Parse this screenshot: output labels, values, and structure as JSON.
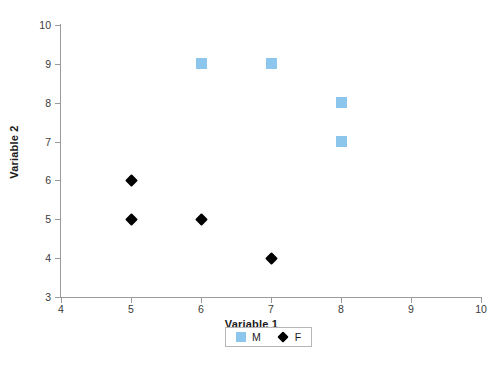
{
  "chart_data": {
    "type": "scatter",
    "title": "",
    "xlabel": "Variable 1",
    "ylabel": "Variable 2",
    "xlim": [
      4,
      10
    ],
    "ylim": [
      3,
      10
    ],
    "xticks": [
      "4",
      "5",
      "6",
      "7",
      "8",
      "9",
      "10"
    ],
    "yticks": [
      "10",
      "9",
      "8",
      "7",
      "6",
      "5",
      "4",
      "3"
    ],
    "grid": false,
    "legend_position": "bottom-center",
    "series": [
      {
        "name": "M",
        "marker": "square",
        "color": "#8DC6EC",
        "points": [
          {
            "x": 6,
            "y": 9
          },
          {
            "x": 7,
            "y": 9
          },
          {
            "x": 8,
            "y": 8
          },
          {
            "x": 8,
            "y": 7
          }
        ]
      },
      {
        "name": "F",
        "marker": "diamond",
        "color": "#000000",
        "points": [
          {
            "x": 5,
            "y": 6
          },
          {
            "x": 5,
            "y": 5
          },
          {
            "x": 6,
            "y": 5
          },
          {
            "x": 7,
            "y": 4
          }
        ]
      }
    ]
  },
  "colors": {
    "series_m": "#8DC6EC",
    "series_f": "#000000",
    "axis": "#9a9a9a",
    "text": "#1a1a1a",
    "background": "#ffffff"
  }
}
